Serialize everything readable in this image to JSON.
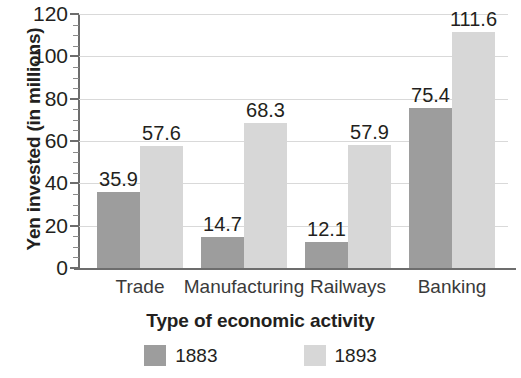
{
  "chart_data": {
    "type": "bar",
    "title": "",
    "subtitle": "",
    "xlabel": "Type of economic activity",
    "ylabel": "Yen invested (in millions)",
    "categories": [
      "Trade",
      "Manufacturing",
      "Railways",
      "Banking"
    ],
    "series": [
      {
        "name": "1883",
        "color": "#9d9d9d",
        "values": [
          35.9,
          14.7,
          12.1,
          75.4
        ],
        "labels": [
          "35.9",
          "14.7",
          "12.1",
          "75.4"
        ]
      },
      {
        "name": "1893",
        "color": "#d7d7d7",
        "values": [
          57.6,
          68.3,
          57.9,
          111.6
        ],
        "labels": [
          "57.6",
          "68.3",
          "57.9",
          "111.6"
        ]
      }
    ],
    "ylim": [
      0,
      120
    ],
    "y_ticks": [
      0,
      20,
      40,
      60,
      80,
      100,
      120
    ],
    "y_tick_labels": [
      "0",
      "20",
      "40",
      "60",
      "80",
      "100",
      "120"
    ],
    "y_minor_tick_step": 5,
    "grid": true,
    "grid_axis": "y",
    "legend_position": "bottom",
    "bar_value_labels": true,
    "group_gap": true
  },
  "legend": {
    "items": [
      {
        "label": "1883",
        "color": "#9d9d9d",
        "swatch_name": "legend-swatch-1883"
      },
      {
        "label": "1893",
        "color": "#d7d7d7",
        "swatch_name": "legend-swatch-1893"
      }
    ]
  },
  "colors": {
    "series_1883": "#9d9d9d",
    "series_1893": "#d7d7d7",
    "axis": "#6d6d6d",
    "gridline": "#d9d9d9",
    "text": "#231f20",
    "background": "#ffffff"
  }
}
